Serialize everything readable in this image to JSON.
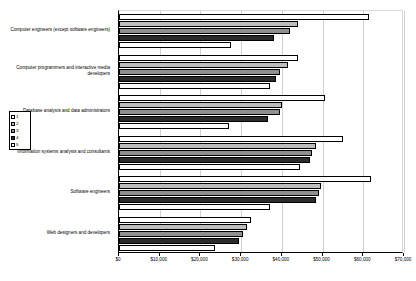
{
  "chart_data": {
    "type": "bar",
    "orientation": "horizontal",
    "title": "",
    "xlabel": "",
    "ylabel": "",
    "xlim": [
      0,
      70000
    ],
    "xticks": [
      0,
      10000,
      20000,
      30000,
      40000,
      50000,
      60000,
      70000
    ],
    "xtick_labels": [
      "$0",
      "$10,000",
      "$20,000",
      "$30,000",
      "$40,000",
      "$50,000",
      "$60,000",
      "$70,000"
    ],
    "grid": true,
    "legend_position": "left",
    "categories": [
      "Computer engineers (except software engineers)",
      "Computer programmers and interactive media developers",
      "Database analysts and data administrators",
      "Information systems analysts and consultants",
      "Software engineers",
      "Web designers and developers"
    ],
    "series": [
      {
        "name": "1",
        "color": "#ffffff",
        "values": [
          61500,
          44000,
          50500,
          55000,
          62000,
          32500
        ]
      },
      {
        "name": "2",
        "color": "#bdbdbd",
        "values": [
          44000,
          41500,
          40000,
          48500,
          49500,
          31500
        ]
      },
      {
        "name": "3",
        "color": "#8f8f8f",
        "values": [
          42000,
          39500,
          39500,
          47500,
          49000,
          30500
        ]
      },
      {
        "name": "4",
        "color": "#2b2b2b",
        "values": [
          38000,
          38500,
          36500,
          47000,
          48500,
          29500
        ]
      },
      {
        "name": "5",
        "color": "#ffffff",
        "values": [
          27500,
          37000,
          27000,
          44500,
          37000,
          23500
        ]
      }
    ]
  },
  "legend": {
    "items": [
      {
        "label": "1",
        "swatch": "#ffffff"
      },
      {
        "label": "2",
        "swatch": "#bdbdbd"
      },
      {
        "label": "3",
        "swatch": "#8f8f8f"
      },
      {
        "label": "4",
        "swatch": "#2b2b2b"
      },
      {
        "label": "5",
        "swatch": "#ffffff"
      }
    ]
  }
}
